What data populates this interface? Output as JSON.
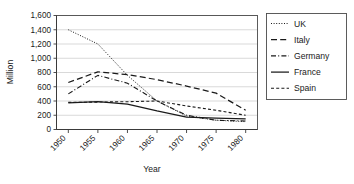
{
  "chart_data": {
    "type": "line",
    "title": "",
    "xlabel": "Year",
    "ylabel": "Million",
    "x": [
      1950,
      1955,
      1960,
      1965,
      1970,
      1975,
      1980
    ],
    "xticklabels": [
      "1950",
      "1955",
      "1960",
      "1965",
      "1970",
      "1975",
      "1980"
    ],
    "xlim": [
      1948,
      1982
    ],
    "ylim": [
      0,
      1600
    ],
    "yticks": [
      0,
      200,
      400,
      600,
      800,
      1000,
      1200,
      1400,
      1600
    ],
    "yticklabels": [
      "0",
      "200",
      "400",
      "600",
      "800",
      "1,000",
      "1,200",
      "1,400",
      "1,600"
    ],
    "grid": "horizontal",
    "legend_position": "right",
    "series": [
      {
        "name": "UK",
        "style": "dotted",
        "dasharray": "1,1.6",
        "width": 1.0,
        "values": [
          1400,
          1200,
          760,
          400,
          190,
          130,
          110
        ]
      },
      {
        "name": "Italy",
        "style": "long-dash",
        "dasharray": "6,3.2",
        "width": 1.25,
        "values": [
          660,
          810,
          770,
          700,
          610,
          510,
          270
        ]
      },
      {
        "name": "Germany",
        "style": "dash-dot",
        "dasharray": "5,2.2,1,2.2",
        "width": 1.1,
        "values": [
          500,
          760,
          650,
          400,
          200,
          130,
          120
        ]
      },
      {
        "name": "France",
        "style": "solid",
        "dasharray": "none",
        "width": 1.25,
        "values": [
          375,
          390,
          355,
          260,
          175,
          160,
          150
        ]
      },
      {
        "name": "Spain",
        "style": "short-dash",
        "dasharray": "3,2.2",
        "width": 1.1,
        "values": [
          380,
          385,
          390,
          400,
          330,
          270,
          200
        ]
      }
    ]
  },
  "legend": {
    "items": [
      {
        "label": "UK"
      },
      {
        "label": "Italy"
      },
      {
        "label": "Germany"
      },
      {
        "label": "France"
      },
      {
        "label": "Spain"
      }
    ]
  }
}
